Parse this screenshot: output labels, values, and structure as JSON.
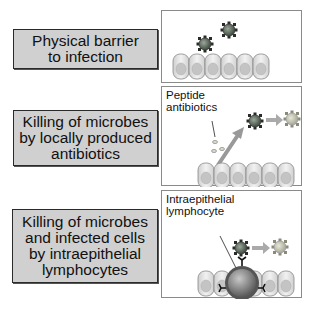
{
  "rows": [
    {
      "label": "Physical barrier\nto infection",
      "panel": {
        "caption": "",
        "icons": [
          "microbe-icon",
          "microbe-icon",
          "epithelial-cell-layer-icon"
        ]
      }
    },
    {
      "label": "Killing of microbes\nby locally produced\nantibiotics",
      "panel": {
        "caption": "Peptide\nantibiotics",
        "icons": [
          "peptide-antibiotic-icon",
          "arrow-icon",
          "microbe-icon",
          "arrow-icon",
          "dead-microbe-icon",
          "epithelial-cell-layer-icon"
        ]
      }
    },
    {
      "label": "Killing of microbes\nand infected cells\nby intraepithelial\nlymphocytes",
      "panel": {
        "caption": "Intraepithelial\nlymphocyte",
        "icons": [
          "microbe-icon",
          "arrow-icon",
          "dead-microbe-icon",
          "lymphocyte-icon",
          "receptor-icon",
          "epithelial-cell-layer-icon"
        ]
      }
    }
  ],
  "colors": {
    "label_box_fill": "#d0d0d0",
    "label_box_border": "#2a2a2a",
    "panel_border": "#8a8a8a",
    "microbe": "#5a6a5a",
    "dead_microbe": "#b8b8a8",
    "arrow": "#a0a0a0",
    "cell_fill": "#e4e4e4",
    "lymphocyte": "#8a8a8a"
  }
}
